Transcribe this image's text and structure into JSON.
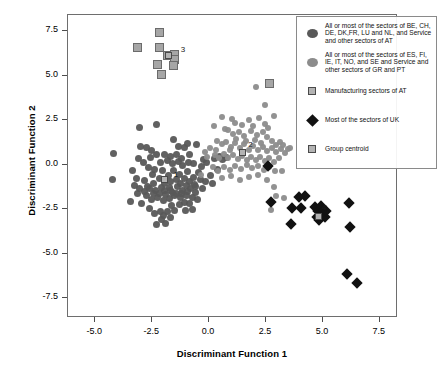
{
  "chart_data": {
    "type": "scatter",
    "title": "",
    "xlabel": "Discriminant Function 1",
    "ylabel": "Discriminant Function 2",
    "xlim": [
      -6.2,
      8.3
    ],
    "ylim": [
      -8.6,
      8.4
    ],
    "xticks": [
      "-5.0",
      "-2.5",
      "0.0",
      "2.5",
      "5.0",
      "7.5"
    ],
    "xtick_values": [
      -5.0,
      -2.5,
      0.0,
      2.5,
      5.0,
      7.5
    ],
    "yticks": [
      "7.5",
      "5.0",
      "2.5",
      "0.0",
      "-2.5",
      "-5.0",
      "-7.5"
    ],
    "ytick_values": [
      7.5,
      5.0,
      2.5,
      0.0,
      -2.5,
      -5.0,
      -7.5
    ],
    "grid": false,
    "legend_position": "top-right",
    "colors": {
      "group1": "#595959",
      "group2": "#8c8c8c",
      "group3": "#a6a6a6",
      "group4": "#111111",
      "centroid_fill": "#b3b3b3",
      "centroid_edge": "#4a4a4a",
      "frame": "#6e6e6e"
    },
    "group_labels": [
      {
        "text": "1",
        "x": -1.55,
        "y": -0.55
      },
      {
        "text": "2",
        "x": 1.72,
        "y": 1.08
      },
      {
        "text": "3",
        "x": -1.25,
        "y": 6.45
      },
      {
        "text": "4",
        "x": 4.95,
        "y": -2.45
      }
    ],
    "centroids": [
      {
        "group": "1",
        "x": -1.95,
        "y": -0.85
      },
      {
        "group": "2",
        "x": 1.45,
        "y": 0.68
      },
      {
        "group": "3",
        "x": -1.78,
        "y": 6.12
      },
      {
        "group": "4",
        "x": 4.82,
        "y": -2.88
      }
    ],
    "series": [
      {
        "name": "All or most of the sectors of BE, CH, DE, DK,FR, LU and NL, and Service and other sectors of AT",
        "marker": "circle",
        "color": "#595959",
        "size": 7,
        "points": [
          [
            -4.2,
            0.65
          ],
          [
            -4.25,
            -0.85
          ],
          [
            -3.05,
            2.1
          ],
          [
            -3.0,
            1.0
          ],
          [
            -2.55,
            0.82
          ],
          [
            -2.58,
            0.4
          ],
          [
            -2.3,
            2.25
          ],
          [
            -3.35,
            -0.35
          ],
          [
            -3.3,
            -1.15
          ],
          [
            -3.15,
            -1.6
          ],
          [
            -3.45,
            -2.05
          ],
          [
            -2.95,
            -2.2
          ],
          [
            -2.6,
            -2.45
          ],
          [
            -2.4,
            -2.75
          ],
          [
            -2.3,
            -3.35
          ],
          [
            -2.15,
            -2.6
          ],
          [
            -2.0,
            -2.85
          ],
          [
            -1.85,
            -2.65
          ],
          [
            -1.65,
            -2.3
          ],
          [
            -1.5,
            -2.55
          ],
          [
            -1.3,
            -2.25
          ],
          [
            -1.1,
            -2.1
          ],
          [
            -0.85,
            -2.2
          ],
          [
            -0.6,
            -1.55
          ],
          [
            -0.55,
            1.15
          ],
          [
            -0.35,
            -0.1
          ],
          [
            -0.25,
            0.3
          ],
          [
            -0.1,
            0.15
          ],
          [
            0.05,
            -0.6
          ],
          [
            0.25,
            0.35
          ],
          [
            0.45,
            0.45
          ],
          [
            0.6,
            0.28
          ],
          [
            0.75,
            0.4
          ],
          [
            -2.85,
            -0.9
          ],
          [
            -2.7,
            -1.25
          ],
          [
            -2.5,
            -0.55
          ],
          [
            -2.45,
            -1.05
          ],
          [
            -2.35,
            -1.45
          ],
          [
            -2.2,
            -0.75
          ],
          [
            -2.1,
            -1.3
          ],
          [
            -2.05,
            -0.35
          ],
          [
            -1.95,
            -1.05
          ],
          [
            -1.9,
            -1.65
          ],
          [
            -1.8,
            -0.6
          ],
          [
            -1.75,
            -1.3
          ],
          [
            -1.7,
            -0.95
          ],
          [
            -1.6,
            -1.55
          ],
          [
            -1.55,
            -0.3
          ],
          [
            -1.45,
            -0.85
          ],
          [
            -1.4,
            -1.25
          ],
          [
            -1.3,
            -0.55
          ],
          [
            -1.25,
            -1.05
          ],
          [
            -1.15,
            -1.45
          ],
          [
            -1.1,
            -0.75
          ],
          [
            -1.0,
            -1.15
          ],
          [
            -0.95,
            -0.4
          ],
          [
            -0.85,
            -0.95
          ],
          [
            -0.8,
            -1.35
          ],
          [
            -0.7,
            -0.7
          ],
          [
            -0.65,
            -1.1
          ],
          [
            -2.75,
            -1.75
          ],
          [
            -2.55,
            -1.95
          ],
          [
            -2.25,
            -1.85
          ],
          [
            -2.0,
            -2.0
          ],
          [
            -1.75,
            -1.9
          ],
          [
            -1.5,
            -1.75
          ],
          [
            -1.25,
            -1.85
          ],
          [
            -1.0,
            -1.7
          ],
          [
            -0.75,
            -1.85
          ],
          [
            -0.5,
            -1.95
          ],
          [
            -2.65,
            -0.15
          ],
          [
            -2.4,
            -0.25
          ],
          [
            -2.15,
            0.1
          ],
          [
            -1.85,
            0.25
          ],
          [
            -1.6,
            0.05
          ],
          [
            -1.35,
            0.2
          ],
          [
            -1.15,
            -0.05
          ],
          [
            -0.9,
            0.15
          ],
          [
            -0.7,
            0.05
          ],
          [
            -0.45,
            -0.45
          ],
          [
            -2.3,
            0.6
          ],
          [
            -1.95,
            0.55
          ],
          [
            -1.7,
            0.45
          ],
          [
            -1.45,
            0.6
          ],
          [
            -1.2,
            0.35
          ],
          [
            -3.2,
            -0.75
          ],
          [
            -3.05,
            -1.35
          ],
          [
            -2.85,
            -1.5
          ],
          [
            -2.6,
            -1.35
          ],
          [
            -2.45,
            -1.6
          ],
          [
            -2.2,
            -1.6
          ],
          [
            -1.95,
            -1.45
          ],
          [
            -1.7,
            -1.45
          ],
          [
            -1.45,
            -1.6
          ],
          [
            -1.2,
            -1.6
          ],
          [
            -0.95,
            -1.5
          ],
          [
            -0.6,
            -1.2
          ],
          [
            -0.4,
            -0.85
          ],
          [
            -0.3,
            -1.35
          ],
          [
            -0.15,
            -0.95
          ],
          [
            -1.05,
            -2.55
          ],
          [
            -0.75,
            -2.5
          ],
          [
            -1.9,
            -3.3
          ],
          [
            -2.1,
            -3.05
          ],
          [
            -1.7,
            -2.95
          ],
          [
            -1.35,
            1.05
          ],
          [
            -1.1,
            0.95
          ],
          [
            -0.85,
            0.6
          ],
          [
            0.15,
            -1.05
          ],
          [
            0.35,
            -0.25
          ],
          [
            -2.9,
            0.15
          ],
          [
            -3.1,
            0.35
          ],
          [
            -2.75,
            0.95
          ],
          [
            -1.55,
            1.4
          ],
          [
            -0.95,
            1.2
          ]
        ]
      },
      {
        "name": "All or most of the sectors of ES, FI, IE, IT, NO, and SE and Service and other sectors of GR and PT",
        "marker": "circle",
        "color": "#8c8c8c",
        "size": 6,
        "points": [
          [
            2.05,
            4.35
          ],
          [
            2.45,
            3.35
          ],
          [
            2.85,
            2.75
          ],
          [
            0.55,
            2.7
          ],
          [
            0.2,
            2.2
          ],
          [
            1.15,
            2.35
          ],
          [
            1.45,
            2.25
          ],
          [
            1.75,
            2.5
          ],
          [
            1.95,
            2.2
          ],
          [
            0.85,
            1.95
          ],
          [
            1.05,
            1.75
          ],
          [
            1.3,
            1.85
          ],
          [
            1.55,
            1.6
          ],
          [
            1.85,
            1.9
          ],
          [
            2.1,
            1.65
          ],
          [
            2.35,
            1.85
          ],
          [
            2.55,
            1.55
          ],
          [
            2.75,
            1.35
          ],
          [
            2.95,
            1.1
          ],
          [
            3.1,
            1.25
          ],
          [
            0.35,
            1.35
          ],
          [
            0.55,
            1.15
          ],
          [
            0.75,
            1.3
          ],
          [
            0.95,
            1.0
          ],
          [
            1.15,
            1.2
          ],
          [
            1.35,
            0.95
          ],
          [
            1.55,
            1.15
          ],
          [
            1.75,
            0.85
          ],
          [
            1.95,
            1.05
          ],
          [
            2.15,
            0.8
          ],
          [
            2.35,
            1.0
          ],
          [
            2.55,
            0.75
          ],
          [
            2.75,
            0.95
          ],
          [
            2.95,
            0.7
          ],
          [
            3.15,
            0.9
          ],
          [
            0.25,
            0.55
          ],
          [
            0.45,
            0.35
          ],
          [
            0.65,
            0.6
          ],
          [
            0.85,
            0.35
          ],
          [
            1.05,
            0.55
          ],
          [
            1.25,
            0.3
          ],
          [
            1.45,
            0.5
          ],
          [
            1.65,
            0.25
          ],
          [
            1.85,
            0.45
          ],
          [
            2.05,
            0.25
          ],
          [
            2.25,
            0.45
          ],
          [
            2.45,
            0.2
          ],
          [
            2.65,
            0.4
          ],
          [
            2.85,
            0.15
          ],
          [
            3.05,
            0.35
          ],
          [
            0.15,
            -0.15
          ],
          [
            0.4,
            -0.35
          ],
          [
            0.65,
            -0.1
          ],
          [
            0.9,
            -0.3
          ],
          [
            1.15,
            -0.05
          ],
          [
            1.4,
            -0.25
          ],
          [
            1.65,
            0.0
          ],
          [
            1.9,
            -0.2
          ],
          [
            2.15,
            -0.05
          ],
          [
            2.4,
            -0.3
          ],
          [
            2.65,
            -0.1
          ],
          [
            2.9,
            -0.35
          ],
          [
            0.55,
            -0.75
          ],
          [
            0.95,
            -0.65
          ],
          [
            1.35,
            -0.85
          ],
          [
            1.75,
            -0.7
          ],
          [
            2.15,
            -0.55
          ],
          [
            2.55,
            -0.85
          ],
          [
            2.85,
            -1.25
          ],
          [
            2.95,
            -1.75
          ],
          [
            3.2,
            -0.35
          ],
          [
            3.35,
            0.65
          ],
          [
            3.45,
            0.9
          ],
          [
            3.25,
            1.1
          ],
          [
            3.55,
            0.95
          ],
          [
            -0.1,
            0.45
          ],
          [
            -0.2,
            0.7
          ],
          [
            0.05,
            0.95
          ],
          [
            0.3,
            0.85
          ],
          [
            -0.35,
            -0.6
          ],
          [
            0.7,
            2.0
          ],
          [
            1.0,
            2.55
          ],
          [
            2.2,
            2.6
          ],
          [
            2.45,
            2.3
          ],
          [
            2.6,
            2.05
          ],
          [
            1.2,
            1.45
          ],
          [
            1.6,
            1.35
          ],
          [
            2.0,
            1.4
          ],
          [
            2.3,
            1.2
          ],
          [
            0.9,
            0.8
          ],
          [
            3.3,
            -1.85
          ],
          [
            2.7,
            -2.55
          ]
        ]
      },
      {
        "name": "Manufacturing sectors of AT",
        "marker": "square",
        "color": "#a6a6a6",
        "size": 9,
        "points": [
          [
            -3.15,
            6.6
          ],
          [
            -2.2,
            7.4
          ],
          [
            -2.2,
            6.6
          ],
          [
            -2.25,
            5.65
          ],
          [
            -2.1,
            5.05
          ],
          [
            -1.85,
            6.15
          ],
          [
            -1.5,
            6.2
          ],
          [
            -1.5,
            5.9
          ],
          [
            -1.55,
            5.55
          ],
          [
            2.65,
            4.55
          ]
        ]
      },
      {
        "name": "Most of the sectors of UK",
        "marker": "diamond",
        "color": "#111111",
        "size": 8,
        "points": [
          [
            2.6,
            -0.05
          ],
          [
            2.7,
            -2.1
          ],
          [
            3.65,
            -2.45
          ],
          [
            3.6,
            -3.35
          ],
          [
            4.05,
            -2.45
          ],
          [
            4.2,
            -1.75
          ],
          [
            3.95,
            -1.8
          ],
          [
            4.65,
            -2.4
          ],
          [
            4.8,
            -2.6
          ],
          [
            4.9,
            -2.3
          ],
          [
            5.0,
            -2.55
          ],
          [
            4.95,
            -2.9
          ],
          [
            4.85,
            -3.1
          ],
          [
            5.1,
            -2.95
          ],
          [
            5.15,
            -2.6
          ],
          [
            4.75,
            -2.95
          ],
          [
            6.15,
            -2.15
          ],
          [
            6.2,
            -3.5
          ],
          [
            6.05,
            -6.15
          ],
          [
            6.5,
            -6.65
          ]
        ]
      }
    ]
  },
  "legend": {
    "items": [
      {
        "symbol": "circle-dark",
        "color": "#595959",
        "label": "All or most of the sectors of BE, CH, DE, DK,FR, LU and NL, and Service and other sectors of AT"
      },
      {
        "symbol": "circle-mid",
        "color": "#8c8c8c",
        "label": "All or most of the sectors of ES, FI, IE, IT, NO, and SE and Service and other sectors of GR and PT"
      },
      {
        "symbol": "square-light",
        "color": "#b3b3b3",
        "label": "Manufacturing sectors of AT"
      },
      {
        "symbol": "diamond-black",
        "color": "#111111",
        "label": "Most of the sectors of UK"
      },
      {
        "symbol": "square-light",
        "color": "#b3b3b3",
        "label": "Group centroid"
      }
    ]
  }
}
